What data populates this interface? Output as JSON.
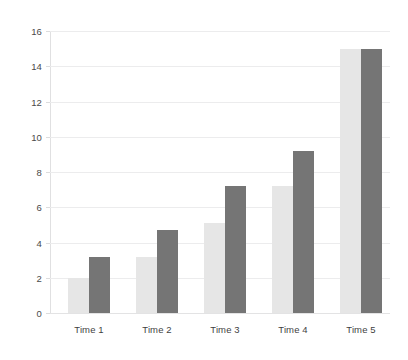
{
  "chart_data": {
    "type": "bar",
    "title": "",
    "subtitle": "",
    "xlabel": "",
    "ylabel": "",
    "categories": [
      "Time 1",
      "Time 2",
      "Time 3",
      "Time 4",
      "Time 5"
    ],
    "series": [
      {
        "name": "Series 1",
        "color": "#e6e6e6",
        "values": [
          2.0,
          3.2,
          5.1,
          7.2,
          15.0
        ]
      },
      {
        "name": "Series 2",
        "color": "#757575",
        "values": [
          3.2,
          4.7,
          7.2,
          9.2,
          15.0
        ]
      }
    ],
    "ylim": [
      0,
      16
    ],
    "yticks": [
      0,
      2,
      4,
      6,
      8,
      10,
      12,
      14,
      16
    ],
    "ytick_labels": [
      "0",
      "2",
      "4",
      "6",
      "8",
      "10",
      "12",
      "14",
      "16"
    ],
    "grid": "horizontal",
    "legend": "none",
    "grouping": "grouped",
    "colors": {
      "background": "#ffffff",
      "gridline": "#ececed",
      "axis_line": "#e0e0e1",
      "tick_label": "#4a4a4a",
      "category_label": "#3f3f3f"
    }
  }
}
